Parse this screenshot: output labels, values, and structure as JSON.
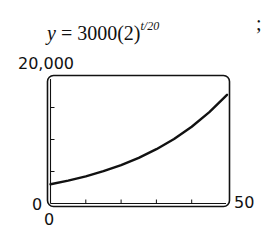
{
  "equation": {
    "lhs": "y",
    "eq": " = 3000(2)",
    "exponent": "t/20"
  },
  "trailing_punct": ";",
  "chart_data": {
    "type": "line",
    "xlabel": "",
    "ylabel": "",
    "xlim": [
      0,
      50
    ],
    "ylim": [
      0,
      20000
    ],
    "x_ticks": [
      0,
      10,
      20,
      30,
      40,
      50
    ],
    "y_ticks": [
      0,
      5000,
      10000,
      15000,
      20000
    ],
    "grid": false,
    "legend": null,
    "axis_labels_shown": {
      "y_max": "20,000",
      "y_min": "0",
      "x_min": "0",
      "x_max": "50"
    },
    "series": [
      {
        "name": "y = 3000(2)^(t/20)",
        "x": [
          0,
          5,
          10,
          15,
          20,
          25,
          30,
          35,
          40,
          45,
          50
        ],
        "values": [
          3000,
          3568,
          4243,
          5045,
          6000,
          7135,
          8485,
          10091,
          12000,
          14270,
          16971
        ]
      }
    ],
    "color": "#111111"
  }
}
